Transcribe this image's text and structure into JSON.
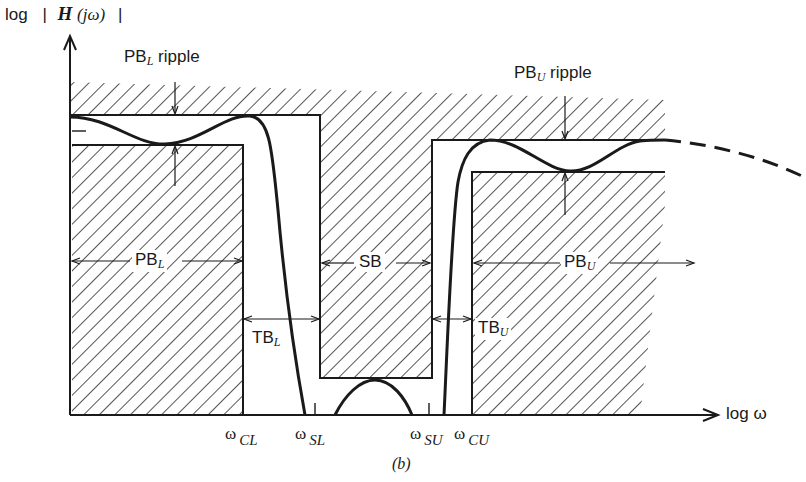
{
  "diagram": {
    "caption": "(b)",
    "y_axis": {
      "label_prefix": "log",
      "label_bar_open": "|",
      "label_func": "H",
      "label_arg": "(jω)",
      "label_bar_close": "|"
    },
    "x_axis": {
      "label": "log ω"
    },
    "ticks": [
      {
        "symbol": "ω",
        "sub": "CL"
      },
      {
        "symbol": "ω",
        "sub": "SL"
      },
      {
        "symbol": "ω",
        "sub": "SU"
      },
      {
        "symbol": "ω",
        "sub": "CU"
      }
    ],
    "regions": {
      "pb_lower": {
        "main": "PB",
        "sub": "L"
      },
      "stopband": {
        "main": "SB"
      },
      "pb_upper": {
        "main": "PB",
        "sub": "U"
      },
      "tb_lower": {
        "main": "TB",
        "sub": "L"
      },
      "tb_upper": {
        "main": "TB",
        "sub": "U"
      }
    },
    "annotations": {
      "pb_lower_ripple": {
        "main": "PB",
        "sub": "L",
        "suffix": " ripple"
      },
      "pb_upper_ripple": {
        "main": "PB",
        "sub": "U",
        "suffix": " ripple"
      }
    },
    "colors": {
      "ink": "#1a1a1a",
      "background": "#ffffff"
    }
  }
}
